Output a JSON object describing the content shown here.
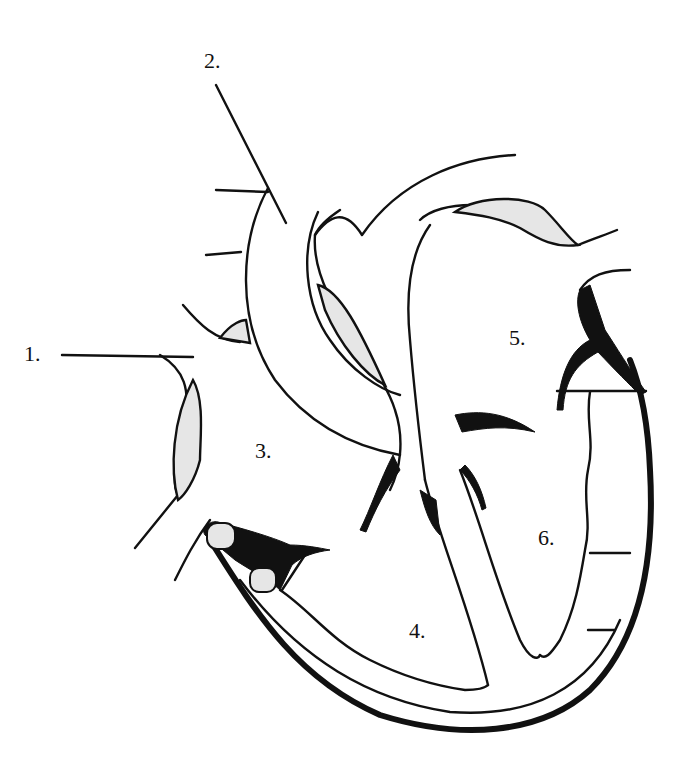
{
  "diagram": {
    "labels": [
      {
        "id": "1",
        "text": "1.",
        "x": 24,
        "y": 343
      },
      {
        "id": "2",
        "text": "2.",
        "x": 204,
        "y": 50
      },
      {
        "id": "3",
        "text": "3.",
        "x": 255,
        "y": 440
      },
      {
        "id": "4",
        "text": "4.",
        "x": 409,
        "y": 620
      },
      {
        "id": "5",
        "text": "5.",
        "x": 509,
        "y": 327
      },
      {
        "id": "6",
        "text": "6.",
        "x": 538,
        "y": 527
      }
    ],
    "colors": {
      "ink": "#111111",
      "shade": "#e6e6e6",
      "background": "#ffffff"
    }
  }
}
